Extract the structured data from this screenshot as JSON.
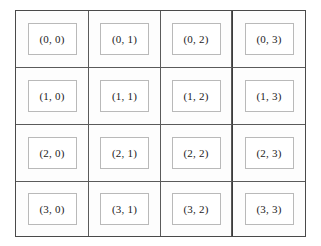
{
  "figure": {
    "type": "grid-layout-diagram",
    "rows": 4,
    "columns": 4,
    "background_color": "#ffffff",
    "cell_background_color": "#fdfdfd",
    "grid_line_color": "#5a5a5a",
    "frame_color": "#4a4a4a",
    "item_border_color": "#b9b9b9",
    "item_background_color": "#ffffff",
    "text_color": "#1b1b1b"
  },
  "grid": {
    "rows": [
      {
        "index": 0,
        "cells": [
          {
            "label": "(0, 0)",
            "row": 0,
            "col": 0
          },
          {
            "label": "(0, 1)",
            "row": 0,
            "col": 1
          },
          {
            "label": "(0, 2)",
            "row": 0,
            "col": 2
          },
          {
            "label": "(0, 3)",
            "row": 0,
            "col": 3
          }
        ]
      },
      {
        "index": 1,
        "cells": [
          {
            "label": "(1, 0)",
            "row": 1,
            "col": 0
          },
          {
            "label": "(1, 1)",
            "row": 1,
            "col": 1
          },
          {
            "label": "(1, 2)",
            "row": 1,
            "col": 2
          },
          {
            "label": "(1, 3)",
            "row": 1,
            "col": 3
          }
        ]
      },
      {
        "index": 2,
        "cells": [
          {
            "label": "(2, 0)",
            "row": 2,
            "col": 0
          },
          {
            "label": "(2, 1)",
            "row": 2,
            "col": 1
          },
          {
            "label": "(2, 2)",
            "row": 2,
            "col": 2
          },
          {
            "label": "(2, 3)",
            "row": 2,
            "col": 3
          }
        ]
      },
      {
        "index": 3,
        "cells": [
          {
            "label": "(3, 0)",
            "row": 3,
            "col": 0
          },
          {
            "label": "(3, 1)",
            "row": 3,
            "col": 1
          },
          {
            "label": "(3, 2)",
            "row": 3,
            "col": 2
          },
          {
            "label": "(3, 3)",
            "row": 3,
            "col": 3
          }
        ]
      }
    ]
  }
}
